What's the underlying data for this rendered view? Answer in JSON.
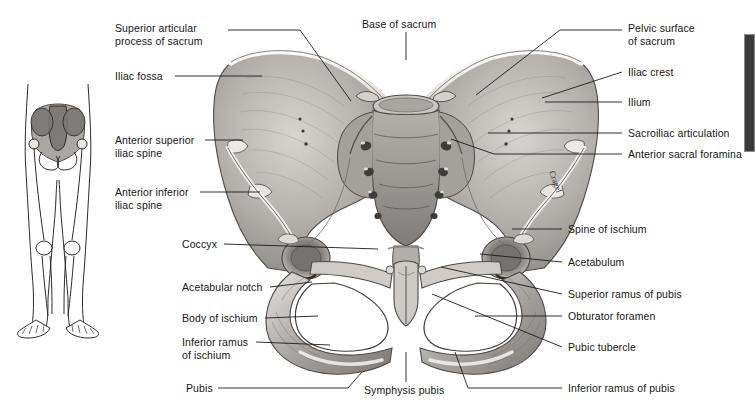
{
  "figure": {
    "signature": "Cragel",
    "background_color": "#ffffff",
    "ink_color": "#151515",
    "bone_light": "#f2f0ee",
    "bone_mid": "#b9b6b2",
    "bone_dark": "#6f6c69"
  },
  "inset": {
    "name": "lower-limb-skeleton-orientation-figure",
    "description": "Small outline drawing of the lower body skeleton with the pelvis shaded"
  },
  "edge_marker": {
    "color": "#3a3a3a",
    "x": 744,
    "y": 34,
    "width": 9,
    "height": 116
  },
  "labels_left": [
    {
      "id": "superior-articular-process-of-sacrum",
      "lines": [
        "Superior articular",
        "process of sacrum"
      ],
      "x": 115,
      "y": 22,
      "leader": [
        [
          228,
          30
        ],
        [
          300,
          30
        ],
        [
          351,
          101
        ]
      ]
    },
    {
      "id": "iliac-fossa",
      "lines": [
        "Iliac fossa"
      ],
      "x": 115,
      "y": 70,
      "leader": [
        [
          175,
          76
        ],
        [
          262,
          76
        ]
      ]
    },
    {
      "id": "anterior-superior-iliac-spine",
      "lines": [
        "Anterior superior",
        "iliac spine"
      ],
      "x": 115,
      "y": 134,
      "leader": [
        [
          205,
          140
        ],
        [
          243,
          140
        ]
      ]
    },
    {
      "id": "anterior-inferior-iliac-spine",
      "lines": [
        "Anterior inferior",
        "iliac spine"
      ],
      "x": 115,
      "y": 186,
      "leader": [
        [
          200,
          192
        ],
        [
          260,
          192
        ]
      ]
    },
    {
      "id": "coccyx",
      "lines": [
        "Coccyx"
      ],
      "x": 182,
      "y": 238,
      "leader": [
        [
          224,
          244
        ],
        [
          378,
          249
        ]
      ]
    },
    {
      "id": "acetabular-notch",
      "lines": [
        "Acetabular notch"
      ],
      "x": 182,
      "y": 281,
      "leader": [
        [
          270,
          287
        ],
        [
          312,
          282
        ]
      ]
    },
    {
      "id": "body-of-ischium",
      "lines": [
        "Body of ischium"
      ],
      "x": 182,
      "y": 312,
      "leader": [
        [
          265,
          318
        ],
        [
          318,
          316
        ]
      ]
    },
    {
      "id": "inferior-ramus-of-ischium",
      "lines": [
        "Inferior ramus",
        "of ischium"
      ],
      "x": 182,
      "y": 336,
      "leader": [
        [
          256,
          342
        ],
        [
          330,
          345
        ]
      ]
    },
    {
      "id": "pubis",
      "lines": [
        "Pubis"
      ],
      "x": 186,
      "y": 382,
      "leader": [
        [
          218,
          388
        ],
        [
          348,
          388
        ],
        [
          362,
          372
        ]
      ]
    }
  ],
  "labels_right": [
    {
      "id": "pelvic-surface-of-sacrum",
      "lines": [
        "Pelvic surface",
        "of sacrum"
      ],
      "x": 628,
      "y": 22,
      "leader": [
        [
          622,
          30
        ],
        [
          560,
          30
        ],
        [
          476,
          95
        ]
      ]
    },
    {
      "id": "iliac-crest",
      "lines": [
        "Iliac crest"
      ],
      "x": 628,
      "y": 66,
      "leader": [
        [
          622,
          72
        ],
        [
          542,
          98
        ]
      ]
    },
    {
      "id": "ilium",
      "lines": [
        "Ilium"
      ],
      "x": 628,
      "y": 96,
      "leader": [
        [
          622,
          102
        ],
        [
          545,
          102
        ]
      ]
    },
    {
      "id": "sacroiliac-articulation",
      "lines": [
        "Sacroiliac articulation"
      ],
      "x": 628,
      "y": 127,
      "leader": [
        [
          622,
          133
        ],
        [
          488,
          133
        ]
      ]
    },
    {
      "id": "anterior-sacral-foramina",
      "lines": [
        "Anterior sacral foramina"
      ],
      "x": 628,
      "y": 148,
      "leader": [
        [
          622,
          154
        ],
        [
          494,
          154
        ],
        [
          451,
          139
        ]
      ]
    },
    {
      "id": "spine-of-ischium",
      "lines": [
        "Spine of ischium"
      ],
      "x": 568,
      "y": 223,
      "leader": [
        [
          562,
          229
        ],
        [
          512,
          229
        ]
      ]
    },
    {
      "id": "acetabulum",
      "lines": [
        "Acetabulum"
      ],
      "x": 568,
      "y": 256,
      "leader": [
        [
          562,
          262
        ],
        [
          480,
          254
        ]
      ]
    },
    {
      "id": "superior-ramus-of-pubis",
      "lines": [
        "Superior ramus of pubis"
      ],
      "x": 568,
      "y": 288,
      "leader": [
        [
          562,
          294
        ],
        [
          441,
          267
        ]
      ]
    },
    {
      "id": "obturator-foramen",
      "lines": [
        "Obturator foramen"
      ],
      "x": 568,
      "y": 310,
      "leader": [
        [
          562,
          316
        ],
        [
          475,
          316
        ]
      ]
    },
    {
      "id": "pubic-tubercle",
      "lines": [
        "Pubic tubercle"
      ],
      "x": 568,
      "y": 341,
      "leader": [
        [
          562,
          347
        ],
        [
          432,
          294
        ]
      ]
    },
    {
      "id": "inferior-ramus-of-pubis",
      "lines": [
        "Inferior ramus of pubis"
      ],
      "x": 568,
      "y": 382,
      "leader": [
        [
          562,
          388
        ],
        [
          468,
          388
        ],
        [
          455,
          352
        ]
      ]
    }
  ],
  "labels_center": [
    {
      "id": "base-of-sacrum",
      "lines": [
        "Base of sacrum"
      ],
      "x": 362,
      "y": 18,
      "leader": [
        [
          406,
          32
        ],
        [
          406,
          60
        ]
      ]
    },
    {
      "id": "symphysis-pubis",
      "lines": [
        "Symphysis pubis"
      ],
      "x": 364,
      "y": 384,
      "leader": [
        [
          406,
          382
        ],
        [
          406,
          352
        ]
      ]
    }
  ]
}
